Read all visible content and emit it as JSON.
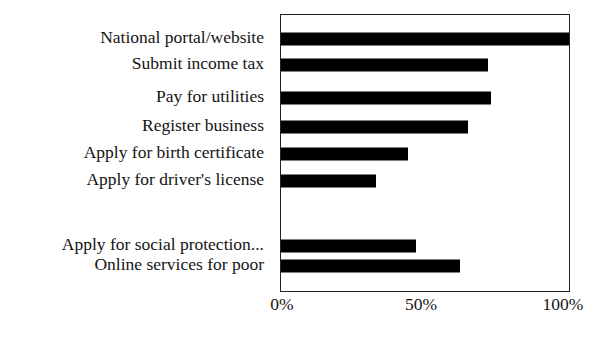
{
  "chart_data": {
    "type": "bar",
    "orientation": "horizontal",
    "title": "",
    "subtitle": "",
    "xlabel": "",
    "ylabel": "",
    "xlim": [
      0,
      100
    ],
    "xticks": [
      0,
      50,
      100
    ],
    "xtick_labels": [
      "0%",
      "50%",
      "100%"
    ],
    "grid": false,
    "legend": null,
    "bar_color": "#000000",
    "frame_color": "#222222",
    "background": "#ffffff",
    "value_unit": "%",
    "categories": [
      "National portal/website",
      "Submit income tax",
      "Pay for utilities",
      "Register business",
      "Apply for birth certificate",
      "Apply for driver's license",
      "",
      "Apply for social protection...",
      "Online services for poor"
    ],
    "values": [
      100,
      72,
      73,
      65,
      44,
      33,
      null,
      47,
      62
    ],
    "bars": [
      {
        "label": "National portal/website",
        "value": 100,
        "row": 0
      },
      {
        "label": "Submit income tax",
        "value": 72,
        "row": 1
      },
      {
        "label": "Pay for utilities",
        "value": 73,
        "row": 2
      },
      {
        "label": "Register business",
        "value": 65,
        "row": 3
      },
      {
        "label": "Apply for birth certificate",
        "value": 44,
        "row": 4
      },
      {
        "label": "Apply for driver's license",
        "value": 33,
        "row": 5
      },
      {
        "label": "",
        "value": null,
        "row": 6
      },
      {
        "label": "Apply for social protection...",
        "value": 47,
        "row": 7
      },
      {
        "label": "Online services for poor",
        "value": 62,
        "row": 8
      }
    ]
  },
  "labels": {
    "row_0": "National portal/website",
    "row_1": "Submit income tax",
    "row_2": "Pay for utilities",
    "row_3": "Register business",
    "row_4": "Apply for birth certificate",
    "row_5": "Apply for driver's license",
    "row_6": "",
    "row_7": "Apply for social protection...",
    "row_8": "Online services for poor"
  },
  "axis": {
    "tick_0": "0%",
    "tick_1": "50%",
    "tick_2": "100%"
  }
}
